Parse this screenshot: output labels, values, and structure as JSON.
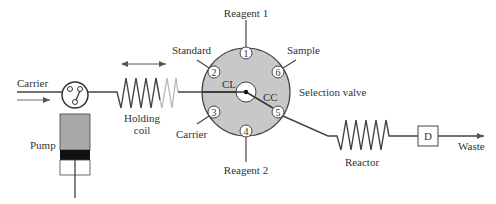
{
  "diagram": {
    "type": "flow-injection sequential injection analysis schematic",
    "colors": {
      "line": "#444444",
      "valve_fill": "#c8c8c8",
      "pump_body": "#a8a8a8",
      "pump_piston": "#111111",
      "holding_coil_faded": "#bbbbbb"
    },
    "labels": {
      "carrier_in": "Carrier",
      "pump": "Pump",
      "holding_coil_line1": "Holding",
      "holding_coil_line2": "coil",
      "standard": "Standard",
      "carrier_port": "Carrier",
      "reagent1": "Reagent 1",
      "reagent2": "Reagent 2",
      "sample": "Sample",
      "selection_valve": "Selection valve",
      "cl": "CL",
      "cc": "CC",
      "reactor": "Reactor",
      "detector": "D",
      "waste": "Waste"
    },
    "ports": [
      {
        "num": "1",
        "name": "Reagent 1"
      },
      {
        "num": "2",
        "name": "Standard"
      },
      {
        "num": "3",
        "name": "Carrier"
      },
      {
        "num": "4",
        "name": "Reagent 2"
      },
      {
        "num": "5",
        "name": "Reactor outlet"
      },
      {
        "num": "6",
        "name": "Sample"
      }
    ]
  }
}
